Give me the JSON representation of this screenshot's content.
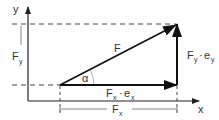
{
  "diagram": {
    "axes": {
      "x_label": "x",
      "y_label": "y"
    },
    "vector": {
      "label": "F",
      "angle_label": "α"
    },
    "components": {
      "x": {
        "main": "F",
        "sub": "x",
        "dot": "·",
        "unit": "e",
        "unit_sub": "x"
      },
      "y": {
        "main": "F",
        "sub": "y",
        "dot": "·",
        "unit": "e",
        "unit_sub": "y"
      }
    },
    "dimensions": {
      "fx": {
        "main": "F",
        "sub": "x"
      },
      "fy": {
        "main": "F",
        "sub": "y"
      }
    },
    "colors": {
      "line": "#222222",
      "dim": "#888888",
      "text": "#333333"
    }
  }
}
